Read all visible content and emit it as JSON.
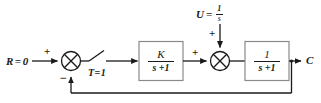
{
  "diagram": {
    "type": "control-system-block-diagram",
    "stroke_color": "#1a1a1a",
    "block_fill": "#ffffff",
    "background": "#ffffff",
    "input": {
      "label_variable": "R",
      "label_equals": "=",
      "label_value": "0",
      "full_label": "R=0"
    },
    "summer_1": {
      "name": "error-summing-junction",
      "plus_sign": "+",
      "minus_sign": "−",
      "glyph": "crossed-circle"
    },
    "switch": {
      "name": "timed-switch",
      "label_variable": "T",
      "label_equals": "=",
      "label_value": "1",
      "full_label": "T=1",
      "state": "open"
    },
    "block_1": {
      "name": "controller-gain-block",
      "numerator": "K",
      "denominator": "s +1",
      "transfer_function": "K/(s+1)"
    },
    "summer_2": {
      "name": "disturbance-summing-junction",
      "plus_sign_left": "+",
      "plus_sign_top": "+",
      "glyph": "crossed-circle"
    },
    "disturbance": {
      "name": "disturbance-input",
      "label_variable": "U",
      "label_equals": "=",
      "numerator": "1",
      "denominator": "s",
      "full_label": "U = 1/s"
    },
    "block_2": {
      "name": "plant-block",
      "numerator": "1",
      "denominator": "s +1",
      "transfer_function": "1/(s+1)"
    },
    "output": {
      "name": "output-signal",
      "label": "C"
    },
    "feedback": {
      "name": "unity-feedback-path",
      "gain": "1",
      "sign": "negative"
    }
  }
}
